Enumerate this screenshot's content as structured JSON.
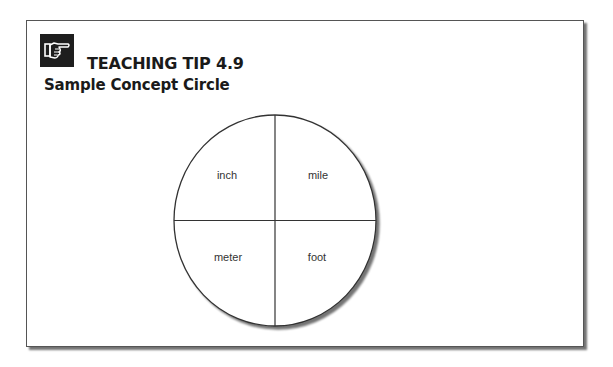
{
  "tip": {
    "icon": "pointing-hand-icon",
    "heading": "TEACHING TIP 4.9",
    "subheading": "Sample Concept Circle"
  },
  "concept_circle": {
    "quadrants": [
      {
        "position": "top-left",
        "label": "inch"
      },
      {
        "position": "top-right",
        "label": "mile"
      },
      {
        "position": "bottom-left",
        "label": "meter"
      },
      {
        "position": "bottom-right",
        "label": "foot"
      }
    ]
  },
  "colors": {
    "border": "#555555",
    "icon_background": "#1e1e1e",
    "text": "#1a1a1a",
    "label_text": "#333333"
  }
}
